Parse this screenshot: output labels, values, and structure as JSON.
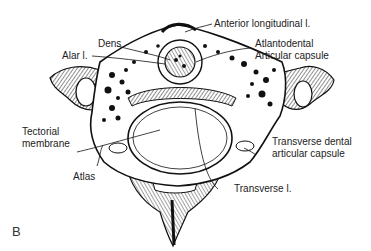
{
  "figure": {
    "panel_letter": "B",
    "colors": {
      "ink": "#111111",
      "bone_fill": "#ffffff",
      "label_text": "#222222"
    }
  },
  "labels": {
    "anterior_longitudinal": "Anterior longitudinal l.",
    "dens": "Dens",
    "alar": "Alar l.",
    "atlantodental_1": "Atlantodental",
    "atlantodental_2": "Articular capsule",
    "tectorial_1": "Tectorial",
    "tectorial_2": "membrane",
    "transverse_dental_1": "Transverse dental",
    "transverse_dental_2": "articular capsule",
    "atlas": "Atlas",
    "transverse": "Transverse l."
  }
}
